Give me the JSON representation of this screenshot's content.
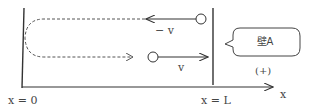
{
  "diagram": {
    "labels": {
      "velocity_left": "− v",
      "velocity_right": "v",
      "wall_name": "壁A",
      "positive_dir": "(+)",
      "x_origin": "x = 0",
      "x_wall": "x = L",
      "axis": "x"
    },
    "colors": {
      "line": "#333333",
      "text": "#444444"
    }
  }
}
